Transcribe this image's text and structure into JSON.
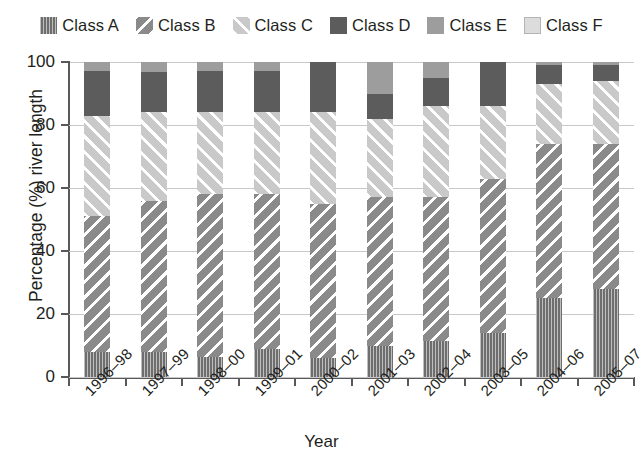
{
  "legend": {
    "items": [
      {
        "label": "Class A",
        "key": "A",
        "swatch": "vertical-hatch-dark-swatch",
        "color": "#6e6e6e"
      },
      {
        "label": "Class B",
        "key": "B",
        "swatch": "backslash-hatch-swatch",
        "color": "#8a8a8a"
      },
      {
        "label": "Class C",
        "key": "C",
        "swatch": "forwardslash-hatch-light-swatch",
        "color": "#c9c9c9"
      },
      {
        "label": "Class D",
        "key": "D",
        "swatch": "solid-dark-swatch",
        "color": "#5c5c5c"
      },
      {
        "label": "Class E",
        "key": "E",
        "swatch": "solid-mid-gray-swatch",
        "color": "#9d9d9d"
      },
      {
        "label": "Class F",
        "key": "F",
        "swatch": "solid-light-gray-swatch",
        "color": "#dcdcdc"
      }
    ]
  },
  "axes": {
    "y_title": "Percentage (%) river length",
    "x_title": "Year",
    "y_ticks": [
      "0",
      "20",
      "40",
      "60",
      "80",
      "100"
    ]
  },
  "chart_data": {
    "type": "bar",
    "subtype": "stacked-percentage",
    "title": "",
    "xlabel": "Year",
    "ylabel": "Percentage (%) river length",
    "ylim": [
      0,
      100
    ],
    "yticks": [
      0,
      20,
      40,
      60,
      80,
      100
    ],
    "grid": true,
    "legend_position": "top",
    "categories": [
      "1996–98",
      "1997–99",
      "1998–00",
      "1999–01",
      "2000–02",
      "2001–03",
      "2002–04",
      "2003–05",
      "2004–06",
      "2005–07"
    ],
    "series": [
      {
        "name": "Class A",
        "values": [
          8,
          8,
          6.5,
          9,
          6,
          10,
          11.5,
          14,
          25,
          28
        ]
      },
      {
        "name": "Class B",
        "values": [
          43,
          48,
          51.5,
          49,
          49,
          47,
          45.5,
          49,
          49,
          46
        ]
      },
      {
        "name": "Class C",
        "values": [
          32,
          28,
          26,
          26,
          29,
          25,
          29,
          23,
          19,
          20
        ]
      },
      {
        "name": "Class D",
        "values": [
          14,
          13,
          13,
          13,
          16,
          8,
          9,
          14,
          6,
          5
        ]
      },
      {
        "name": "Class E",
        "values": [
          3,
          3,
          3,
          3,
          0,
          10,
          5,
          0,
          1,
          1
        ]
      },
      {
        "name": "Class F",
        "values": [
          0,
          0,
          0,
          0,
          0,
          0,
          0,
          0,
          0,
          0
        ]
      }
    ]
  }
}
